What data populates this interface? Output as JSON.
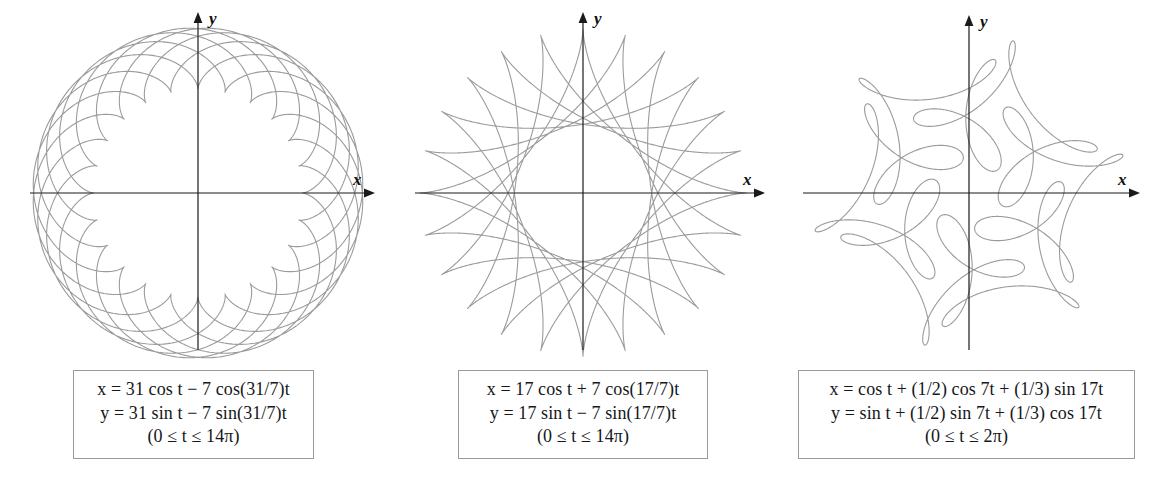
{
  "page": {
    "background_color": "#ffffff",
    "curve_color": "#9b9b9b",
    "axis_color": "#1a1a1a",
    "caption_border_color": "#9a9a9a",
    "width": 1156,
    "height": 480
  },
  "panels": [
    {
      "id": "panel-1",
      "name": "hypotrochoid-31-7",
      "axis": {
        "x_label": "x",
        "y_label": "y",
        "origin_x": 198,
        "origin_y": 193,
        "x_start": 30,
        "x_end": 375,
        "y_top": 12,
        "y_bottom": 350
      },
      "caption": {
        "line1": "x = 31 cos t − 7 cos(31/7)t",
        "line2": "y = 31 sin t − 7 sin(31/7)t",
        "line3": "(0 ≤ t ≤ 14π)"
      },
      "chart_data": {
        "type": "line",
        "title": "",
        "xlabel": "x",
        "ylabel": "y",
        "grid": false,
        "legend": "none",
        "parametric": {
          "x_expression": "31*cos(t) - 7*cos((31/7)*t)",
          "y_expression": "31*sin(t) - 7*sin((31/7)*t)",
          "t_min": 0,
          "t_max": 43.982297,
          "t_max_label": "14*pi",
          "samples": 5000,
          "R": 31,
          "r": 7,
          "ratio": "31/7",
          "sign_x": "-",
          "sign_y": "-"
        },
        "xlim": [
          -38,
          38
        ],
        "ylim": [
          -38,
          38
        ],
        "extent_radius": 38,
        "pixels_per_unit": 4.35
      }
    },
    {
      "id": "panel-2",
      "name": "epitrochoid-17-7",
      "axis": {
        "x_label": "x",
        "y_label": "y",
        "origin_x": 583,
        "origin_y": 193,
        "x_start": 415,
        "x_end": 765,
        "y_top": 12,
        "y_bottom": 350
      },
      "caption": {
        "line1": "x = 17 cos t + 7 cos(17/7)t",
        "line2": "y = 17 sin t − 7 sin(17/7)t",
        "line3": "(0 ≤ t ≤ 14π)"
      },
      "chart_data": {
        "type": "line",
        "title": "",
        "xlabel": "x",
        "ylabel": "y",
        "grid": false,
        "legend": "none",
        "parametric": {
          "x_expression": "17*cos(t) + 7*cos((17/7)*t)",
          "y_expression": "17*sin(t) - 7*sin((17/7)*t)",
          "t_min": 0,
          "t_max": 43.982297,
          "t_max_label": "14*pi",
          "samples": 5000,
          "R": 17,
          "r": 7,
          "ratio": "17/7",
          "sign_x": "+",
          "sign_y": "-"
        },
        "xlim": [
          -25,
          25
        ],
        "ylim": [
          -25,
          25
        ],
        "extent_radius": 25,
        "pixels_per_unit": 6.8
      }
    },
    {
      "id": "panel-3",
      "name": "harmonic-loops-1-7-17",
      "axis": {
        "x_label": "x",
        "y_label": "y",
        "origin_x": 969,
        "origin_y": 193,
        "x_start": 803,
        "x_end": 1140,
        "y_top": 15,
        "y_bottom": 350
      },
      "caption": {
        "line1": "x = cos t + (1/2) cos 7t + (1/3) sin 17t",
        "line2": "y = sin t + (1/2) sin 7t + (1/3) cos 17t",
        "line3": "(0 ≤ t ≤ 2π)"
      },
      "chart_data": {
        "type": "line",
        "title": "",
        "xlabel": "x",
        "ylabel": "y",
        "grid": false,
        "legend": "none",
        "parametric": {
          "x_expression": "cos(t) + (1/2)*cos(7*t) + (1/3)*sin(17*t)",
          "y_expression": "sin(t) + (1/2)*sin(7*t) + (1/3)*cos(17*t)",
          "t_min": 0,
          "t_max": 6.283185,
          "t_max_label": "2*pi",
          "samples": 6000,
          "harmonics": [
            {
              "n": 1,
              "amplitude": 1
            },
            {
              "n": 7,
              "amplitude": 0.5
            },
            {
              "n": 17,
              "amplitude": 0.3333
            }
          ]
        },
        "xlim": [
          -1.9,
          1.9
        ],
        "ylim": [
          -1.9,
          1.9
        ],
        "extent_radius": 1.9,
        "pixels_per_unit": 88
      }
    }
  ]
}
